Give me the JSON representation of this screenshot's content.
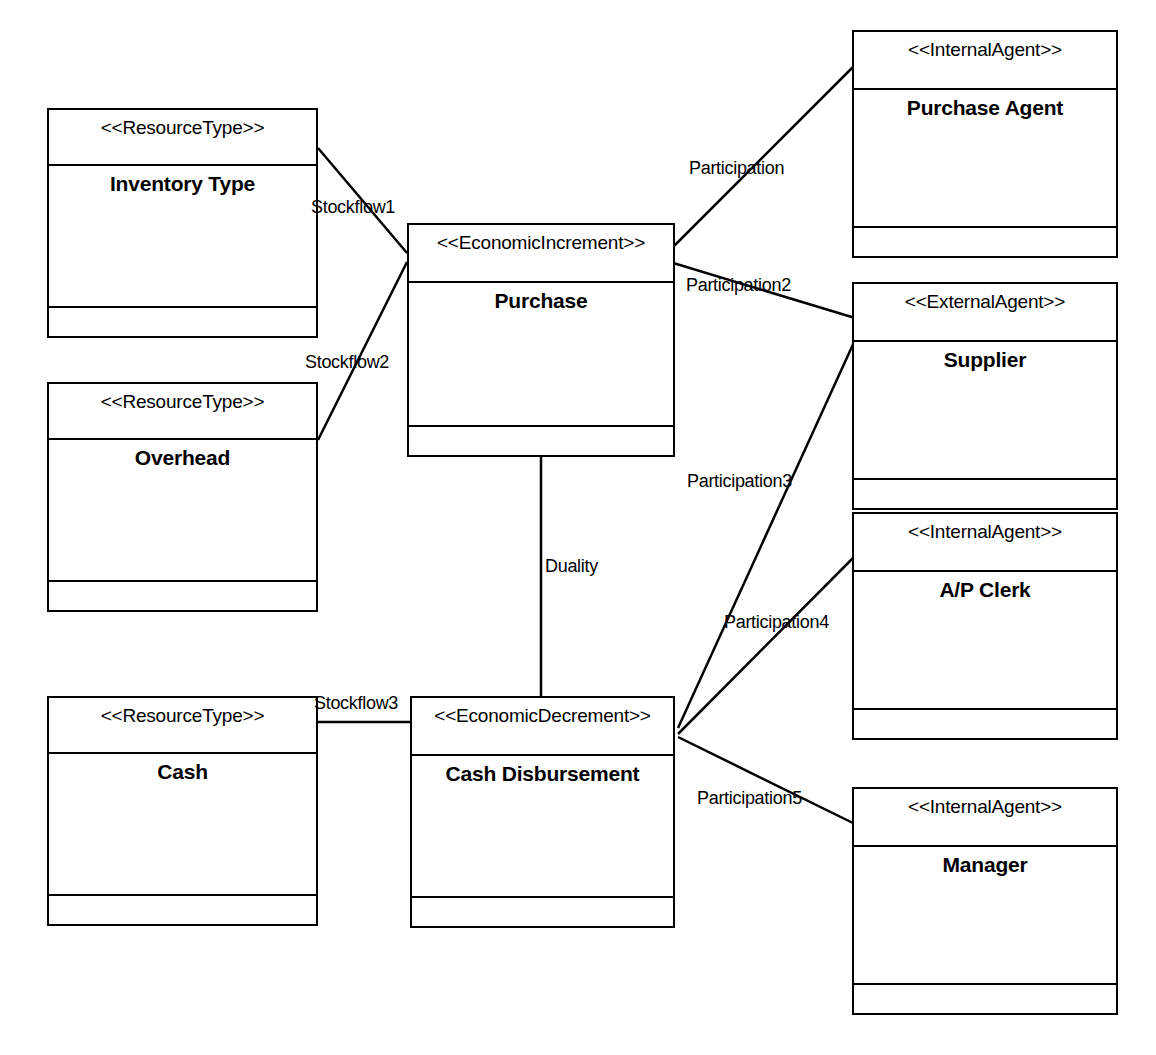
{
  "diagram": {
    "type": "uml-class-diagram",
    "stroke_color": "#000000",
    "background_color": "#ffffff",
    "width": 1156,
    "height": 1055
  },
  "classes": [
    {
      "id": "inventory-type",
      "stereotype": "<<ResourceType>>",
      "name": "Inventory Type",
      "x": 47,
      "y": 108,
      "w": 271,
      "h": 230,
      "header_h": 56,
      "ops_h": 28
    },
    {
      "id": "overhead",
      "stereotype": "<<ResourceType>>",
      "name": "Overhead",
      "x": 47,
      "y": 382,
      "w": 271,
      "h": 230,
      "header_h": 56,
      "ops_h": 28
    },
    {
      "id": "cash",
      "stereotype": "<<ResourceType>>",
      "name": "Cash",
      "x": 47,
      "y": 696,
      "w": 271,
      "h": 230,
      "header_h": 56,
      "ops_h": 28
    },
    {
      "id": "purchase",
      "stereotype": "<<EconomicIncrement>>",
      "name": "Purchase",
      "x": 407,
      "y": 223,
      "w": 268,
      "h": 234,
      "header_h": 58,
      "ops_h": 28
    },
    {
      "id": "cash-disbursement",
      "stereotype": "<<EconomicDecrement>>",
      "name": "Cash Disbursement",
      "x": 410,
      "y": 696,
      "w": 265,
      "h": 232,
      "header_h": 58,
      "ops_h": 28
    },
    {
      "id": "purchase-agent",
      "stereotype": "<<InternalAgent>>",
      "name": "Purchase Agent",
      "x": 852,
      "y": 30,
      "w": 266,
      "h": 228,
      "header_h": 58,
      "ops_h": 28
    },
    {
      "id": "supplier",
      "stereotype": "<<ExternalAgent>>",
      "name": "Supplier",
      "x": 852,
      "y": 282,
      "w": 266,
      "h": 228,
      "header_h": 58,
      "ops_h": 28
    },
    {
      "id": "ap-clerk",
      "stereotype": "<<InternalAgent>>",
      "name": "A/P Clerk",
      "x": 852,
      "y": 512,
      "w": 266,
      "h": 228,
      "header_h": 58,
      "ops_h": 28
    },
    {
      "id": "manager",
      "stereotype": "<<InternalAgent>>",
      "name": "Manager",
      "x": 852,
      "y": 787,
      "w": 266,
      "h": 228,
      "header_h": 58,
      "ops_h": 28
    }
  ],
  "associations": [
    {
      "id": "stockflow1",
      "label": "Stockflow1",
      "from": "inventory-type",
      "to": "purchase",
      "x1": 318,
      "y1": 148,
      "x2": 407,
      "y2": 253,
      "label_x": 311,
      "label_y": 197
    },
    {
      "id": "stockflow2",
      "label": "Stockflow2",
      "from": "overhead",
      "to": "purchase",
      "x1": 318,
      "y1": 440,
      "x2": 407,
      "y2": 262,
      "label_x": 305,
      "label_y": 352
    },
    {
      "id": "stockflow3",
      "label": "Stockflow3",
      "from": "cash",
      "to": "cash-disbursement",
      "x1": 318,
      "y1": 722,
      "x2": 410,
      "y2": 722,
      "label_x": 314,
      "label_y": 693
    },
    {
      "id": "duality",
      "label": "Duality",
      "from": "purchase",
      "to": "cash-disbursement",
      "x1": 541,
      "y1": 457,
      "x2": 541,
      "y2": 696,
      "label_x": 545,
      "label_y": 556
    },
    {
      "id": "participation",
      "label": "Participation",
      "from": "purchase",
      "to": "purchase-agent",
      "x1": 670,
      "y1": 250,
      "x2": 855,
      "y2": 65,
      "label_x": 689,
      "label_y": 158
    },
    {
      "id": "participation2",
      "label": "Participation2",
      "from": "purchase",
      "to": "supplier",
      "x1": 670,
      "y1": 262,
      "x2": 855,
      "y2": 318,
      "label_x": 686,
      "label_y": 275
    },
    {
      "id": "participation3",
      "label": "Participation3",
      "from": "cash-disbursement",
      "to": "supplier",
      "x1": 678,
      "y1": 728,
      "x2": 855,
      "y2": 340,
      "label_x": 687,
      "label_y": 471
    },
    {
      "id": "participation4",
      "label": "Participation4",
      "from": "cash-disbursement",
      "to": "ap-clerk",
      "x1": 678,
      "y1": 734,
      "x2": 855,
      "y2": 556,
      "label_x": 724,
      "label_y": 612
    },
    {
      "id": "participation5",
      "label": "Participation5",
      "from": "cash-disbursement",
      "to": "manager",
      "x1": 678,
      "y1": 737,
      "x2": 855,
      "y2": 824,
      "label_x": 697,
      "label_y": 788
    }
  ]
}
